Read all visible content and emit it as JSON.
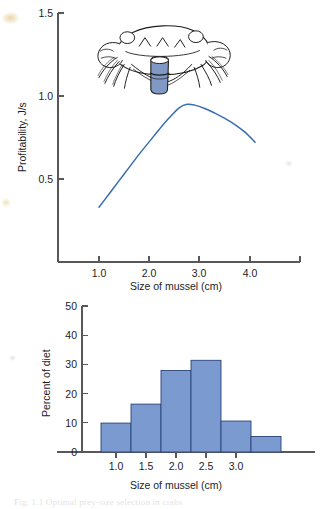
{
  "figure": {
    "caption_partial": "Fig. 1.1  Optimal prey-size selection in crabs",
    "illustration": {
      "name": "crab-holding-mussel",
      "description": "Line drawing of a shore crab holding a blue mussel in its claws",
      "mussel_fill": "#8098c4",
      "outline_color": "#1c1c1c"
    }
  },
  "chart_data": [
    {
      "id": "profitability",
      "type": "line",
      "title": "",
      "xlabel": "Size of mussel (cm)",
      "ylabel": "Profitability, J/s",
      "xlim": [
        0.5,
        4.6
      ],
      "ylim": [
        0.0,
        1.55
      ],
      "xticks": [
        1.0,
        2.0,
        3.0,
        4.0
      ],
      "xticklabels": [
        "1.0",
        "2.0",
        "3.0",
        "4.0"
      ],
      "yticks": [
        0.5,
        1.0,
        1.5
      ],
      "yticklabels": [
        "0.5",
        "1.0",
        "1.5"
      ],
      "grid": false,
      "legend": "none",
      "line_color": "#3a6db0",
      "series": [
        {
          "name": "Profitability",
          "x": [
            1.0,
            1.2,
            1.4,
            1.6,
            1.8,
            2.0,
            2.2,
            2.4,
            2.6,
            2.75,
            2.9,
            3.1,
            3.3,
            3.5,
            3.7,
            3.9,
            4.1
          ],
          "y": [
            0.33,
            0.41,
            0.49,
            0.57,
            0.65,
            0.725,
            0.8,
            0.87,
            0.93,
            0.95,
            0.945,
            0.925,
            0.897,
            0.865,
            0.828,
            0.782,
            0.722
          ]
        }
      ],
      "annotations": [
        {
          "text": "peak profitability near 2.7 cm",
          "x": 2.75,
          "y": 0.95
        }
      ]
    },
    {
      "id": "diet-histogram",
      "type": "bar",
      "title": "",
      "xlabel": "Size of mussel (cm)",
      "ylabel": "Percent of diet",
      "xlim": [
        0.5,
        3.9
      ],
      "ylim": [
        0,
        50
      ],
      "xticks": [
        1.0,
        1.5,
        2.0,
        2.5,
        3.0
      ],
      "xticklabels": [
        "1.0",
        "1.5",
        "2.0",
        "2.5",
        "3.0"
      ],
      "yticks": [
        0,
        10,
        20,
        30,
        40,
        50
      ],
      "yticklabels": [
        "0",
        "10",
        "20",
        "30",
        "40",
        "50"
      ],
      "grid": false,
      "legend": "none",
      "bar_fill": "#7b9bd0",
      "bar_edge": "#28427a",
      "bin_edges": [
        0.75,
        1.25,
        1.5,
        1.75,
        2.0,
        2.25,
        2.5,
        2.75,
        3.0,
        3.25,
        3.5
      ],
      "categories": [
        "0.75-1.25",
        "1.25-1.75",
        "1.75-2.25",
        "2.25-2.75",
        "2.75-3.25",
        "3.25-3.75"
      ],
      "bins": [
        {
          "left": 0.75,
          "right": 1.25,
          "value": 9.9
        },
        {
          "left": 1.25,
          "right": 1.75,
          "value": 16.4
        },
        {
          "left": 1.75,
          "right": 2.25,
          "value": 27.9
        },
        {
          "left": 2.25,
          "right": 2.75,
          "value": 31.4
        },
        {
          "left": 2.75,
          "right": 3.25,
          "value": 10.6
        },
        {
          "left": 3.25,
          "right": 3.75,
          "value": 5.3
        }
      ],
      "values": [
        9.9,
        16.4,
        27.9,
        31.4,
        10.6,
        5.3
      ]
    }
  ]
}
